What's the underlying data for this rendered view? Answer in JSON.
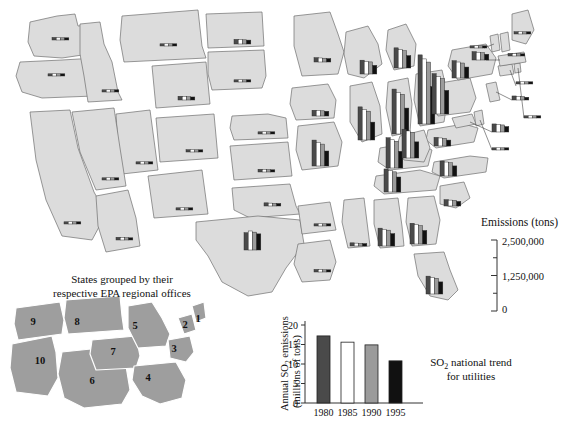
{
  "figure": {
    "legend": {
      "title": "Emissions (tons)",
      "max_label": "2,500,000",
      "mid_label": "1,250,000",
      "min_label": "0",
      "scale_max": 2500000,
      "ticks": [
        0,
        625000,
        1250000,
        1875000,
        2500000
      ]
    },
    "inset": {
      "caption_line1": "States grouped by their",
      "caption_line2": "respective EPA regional offices",
      "regions": [
        {
          "label": "1",
          "x": 198,
          "y": 322
        },
        {
          "label": "2",
          "x": 185,
          "y": 328
        },
        {
          "label": "3",
          "x": 174,
          "y": 352
        },
        {
          "label": "4",
          "x": 148,
          "y": 381
        },
        {
          "label": "5",
          "x": 135,
          "y": 329
        },
        {
          "label": "6",
          "x": 92,
          "y": 384
        },
        {
          "label": "7",
          "x": 113,
          "y": 355
        },
        {
          "label": "8",
          "x": 77,
          "y": 325
        },
        {
          "label": "9",
          "x": 33,
          "y": 325
        },
        {
          "label": "10",
          "x": 40,
          "y": 364
        }
      ]
    },
    "trend_chart": {
      "caption_line1": "SO2 national trend",
      "caption_line2": "for utilities",
      "ylabel_line1": "Annual SO2 emissions",
      "ylabel_line2": "(millions of tons)"
    },
    "series_colors": {
      "1980": "#4a4a4a",
      "1985": "#ffffff",
      "1990": "#9b9b9b",
      "1995": "#111111",
      "state_fill": "#dcdcdc",
      "state_stroke": "#6e6e6e",
      "inset_fill": "#9e9e9e",
      "axis": "#333333"
    }
  },
  "chart_data": [
    {
      "id": "national-trend",
      "type": "bar",
      "title": "SO2 national trend for utilities",
      "xlabel": "",
      "ylabel": "Annual SO2 emissions (millions of tons)",
      "categories": [
        "1980",
        "1985",
        "1990",
        "1995"
      ],
      "values": [
        17.2,
        15.6,
        14.9,
        10.8
      ],
      "ylim": [
        0,
        20
      ],
      "yticks": [
        0,
        5,
        10,
        15,
        20
      ],
      "bar_colors": [
        "#4a4a4a",
        "#ffffff",
        "#9b9b9b",
        "#111111"
      ],
      "grid": false,
      "legend": "none"
    },
    {
      "id": "state-sulfur-dioxide-emissions-map",
      "type": "bar",
      "title": "Sulfur dioxide emissions by state, 1980-1995",
      "ylabel": "Emissions (tons)",
      "ylim": [
        0,
        2500000
      ],
      "categories": [
        "1980",
        "1985",
        "1990",
        "1995"
      ],
      "series": [
        {
          "name": "Washington",
          "values": [
            90000,
            75000,
            70000,
            60000
          ]
        },
        {
          "name": "Oregon",
          "values": [
            30000,
            25000,
            22000,
            20000
          ]
        },
        {
          "name": "Idaho",
          "values": [
            30000,
            25000,
            22000,
            18000
          ]
        },
        {
          "name": "Montana",
          "values": [
            40000,
            35000,
            33000,
            28000
          ]
        },
        {
          "name": "North Dakota",
          "values": [
            160000,
            150000,
            145000,
            135000
          ]
        },
        {
          "name": "South Dakota",
          "values": [
            20000,
            18000,
            16000,
            14000
          ]
        },
        {
          "name": "Wyoming",
          "values": [
            130000,
            120000,
            115000,
            105000
          ]
        },
        {
          "name": "Nebraska",
          "values": [
            60000,
            55000,
            50000,
            45000
          ]
        },
        {
          "name": "Colorado",
          "values": [
            80000,
            72000,
            68000,
            60000
          ]
        },
        {
          "name": "Utah",
          "values": [
            45000,
            40000,
            36000,
            32000
          ]
        },
        {
          "name": "Nevada",
          "values": [
            60000,
            55000,
            50000,
            45000
          ]
        },
        {
          "name": "California",
          "values": [
            45000,
            38000,
            32000,
            26000
          ]
        },
        {
          "name": "Arizona",
          "values": [
            95000,
            85000,
            78000,
            70000
          ]
        },
        {
          "name": "New Mexico",
          "values": [
            50000,
            45000,
            42000,
            38000
          ]
        },
        {
          "name": "Kansas",
          "values": [
            95000,
            88000,
            82000,
            75000
          ]
        },
        {
          "name": "Oklahoma",
          "values": [
            110000,
            100000,
            95000,
            88000
          ]
        },
        {
          "name": "Texas",
          "values": [
            600000,
            660000,
            620000,
            560000
          ]
        },
        {
          "name": "Louisiana",
          "values": [
            90000,
            80000,
            75000,
            68000
          ]
        },
        {
          "name": "Arkansas",
          "values": [
            70000,
            62000,
            58000,
            52000
          ]
        },
        {
          "name": "Minnesota",
          "values": [
            150000,
            140000,
            132000,
            120000
          ]
        },
        {
          "name": "Iowa",
          "values": [
            200000,
            190000,
            180000,
            165000
          ]
        },
        {
          "name": "Missouri",
          "values": [
            900000,
            820000,
            760000,
            520000
          ]
        },
        {
          "name": "Wisconsin",
          "values": [
            480000,
            440000,
            420000,
            300000
          ]
        },
        {
          "name": "Illinois",
          "values": [
            1150000,
            1060000,
            1000000,
            620000
          ]
        },
        {
          "name": "Indiana",
          "values": [
            1560000,
            1450000,
            1380000,
            900000
          ]
        },
        {
          "name": "Ohio",
          "values": [
            2400000,
            2260000,
            2150000,
            1300000
          ]
        },
        {
          "name": "Michigan",
          "values": [
            700000,
            640000,
            600000,
            430000
          ]
        },
        {
          "name": "Kentucky",
          "values": [
            1050000,
            980000,
            930000,
            580000
          ]
        },
        {
          "name": "Tennessee",
          "values": [
            800000,
            740000,
            700000,
            520000
          ]
        },
        {
          "name": "Mississippi",
          "values": [
            110000,
            100000,
            92000,
            85000
          ]
        },
        {
          "name": "Alabama",
          "values": [
            620000,
            580000,
            550000,
            430000
          ]
        },
        {
          "name": "Georgia",
          "values": [
            720000,
            680000,
            640000,
            470000
          ]
        },
        {
          "name": "Florida",
          "values": [
            620000,
            580000,
            545000,
            420000
          ]
        },
        {
          "name": "South Carolina",
          "values": [
            220000,
            205000,
            195000,
            160000
          ]
        },
        {
          "name": "North Carolina",
          "values": [
            520000,
            485000,
            460000,
            350000
          ]
        },
        {
          "name": "Virginia",
          "values": [
            300000,
            280000,
            265000,
            205000
          ]
        },
        {
          "name": "West Virginia",
          "values": [
            1000000,
            940000,
            890000,
            560000
          ]
        },
        {
          "name": "Pennsylvania",
          "values": [
            1400000,
            1300000,
            1230000,
            820000
          ]
        },
        {
          "name": "New York",
          "values": [
            600000,
            555000,
            520000,
            380000
          ]
        },
        {
          "name": "Maryland",
          "values": [
            280000,
            260000,
            245000,
            190000
          ]
        },
        {
          "name": "Delaware",
          "values": [
            70000,
            64000,
            60000,
            50000
          ]
        },
        {
          "name": "New Jersey",
          "values": [
            140000,
            128000,
            120000,
            95000
          ]
        },
        {
          "name": "Connecticut",
          "values": [
            60000,
            55000,
            50000,
            42000
          ]
        },
        {
          "name": "Rhode Island",
          "values": [
            12000,
            10000,
            9000,
            8000
          ]
        },
        {
          "name": "Massachusetts",
          "values": [
            290000,
            270000,
            255000,
            200000
          ]
        },
        {
          "name": "Vermont",
          "values": [
            10000,
            9000,
            8000,
            7000
          ]
        },
        {
          "name": "New Hampshire",
          "values": [
            90000,
            82000,
            78000,
            64000
          ]
        },
        {
          "name": "Maine",
          "values": [
            80000,
            72000,
            66000,
            56000
          ]
        }
      ]
    }
  ]
}
